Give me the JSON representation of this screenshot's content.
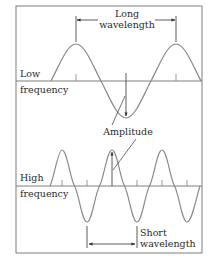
{
  "diagram": {
    "type": "wave-comparison",
    "colors": {
      "wave": "#8a8a8a",
      "axis": "#707070",
      "annotation": "#333333",
      "frame": "#707070",
      "text": "#2a2a2a"
    },
    "panels": [
      {
        "id": "low",
        "label_line1": "Low",
        "label_line2": "frequency",
        "wavelength_label_line1": "Long",
        "wavelength_label_line2": "wavelength"
      },
      {
        "id": "high",
        "label_line1": "High",
        "label_line2": "frequency",
        "wavelength_label_line1": "Short",
        "wavelength_label_line2": "wavelength"
      }
    ],
    "amplitude_label": "Amplitude"
  }
}
